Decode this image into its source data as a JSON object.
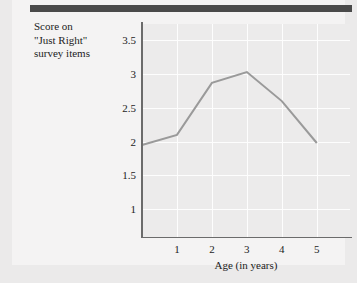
{
  "figure": {
    "y_axis_caption": "Score on\n\"Just Right\"\nsurvey items",
    "x_axis_caption": "Age (in years)"
  },
  "colors": {
    "page_background": "#ebeaea",
    "card_background": "#f4f3f3",
    "top_rule": "#4a4a4a",
    "plot_background": "#ecebeb",
    "gridline": "#fdfdfd",
    "axis_line": "#6b6b6b",
    "series_line": "#9a9a9a",
    "text": "#1c1c1c"
  },
  "chart_data": {
    "type": "line",
    "title": "",
    "subtitle": "",
    "xlabel": "Age (in years)",
    "ylabel": "Score on \"Just Right\" survey items",
    "xlim": [
      0,
      5.95
    ],
    "ylim": [
      0.59,
      3.74
    ],
    "xticks": [
      1,
      2,
      3,
      4,
      5
    ],
    "xtick_labels": [
      "1",
      "2",
      "3",
      "4",
      "5"
    ],
    "yticks": [
      1,
      1.5,
      2,
      2.5,
      3,
      3.5
    ],
    "ytick_labels": [
      "1",
      "1.5",
      "2",
      "2.5",
      "3",
      "3.5"
    ],
    "grid": true,
    "grid_color": "#fdfdfd",
    "legend": false,
    "legend_position": "none",
    "series": [
      {
        "name": "Just Right score",
        "color": "#9a9a9a",
        "line_width": 2,
        "markers": false,
        "x": [
          0,
          1,
          2,
          3,
          4,
          5
        ],
        "values": [
          1.95,
          2.1,
          2.87,
          3.03,
          2.6,
          1.98
        ]
      }
    ]
  }
}
